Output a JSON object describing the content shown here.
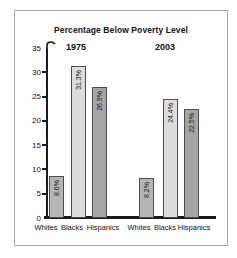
{
  "window": {
    "background": "#ffffff",
    "frame_border_color": "#a8a8a8"
  },
  "chart_data": {
    "type": "bar",
    "title": "Percentage Below Poverty Level",
    "xlabel": "",
    "ylabel": "",
    "ylim": [
      0,
      35
    ],
    "yticks": [
      0,
      5,
      10,
      15,
      20,
      25,
      30,
      35
    ],
    "grid": false,
    "legend": "none",
    "groups": [
      {
        "year": "1975",
        "categories": [
          "Whites",
          "Blacks",
          "Hispanics"
        ],
        "values": [
          8.6,
          31.3,
          26.9
        ],
        "bar_labels": [
          "8.6%",
          "31.3%",
          "26.9%"
        ]
      },
      {
        "year": "2003",
        "categories": [
          "Whites",
          "Blacks",
          "Hispanics"
        ],
        "values": [
          8.2,
          24.4,
          22.5
        ],
        "bar_labels": [
          "8.2%",
          "24.4%",
          "22.5%"
        ]
      }
    ],
    "category_colors": {
      "Whites": "#b5b5b5",
      "Blacks": "#dcdcdc",
      "Hispanics": "#a5a5a5"
    },
    "bar_border_color": "#4d4d4d",
    "axis_color": "#1a1a1a"
  }
}
